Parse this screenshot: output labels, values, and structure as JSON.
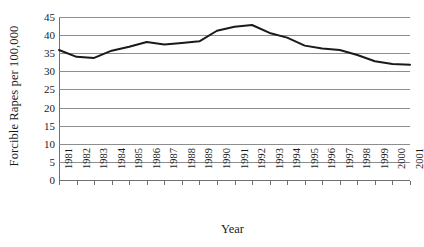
{
  "chart_data": {
    "type": "line",
    "title": "",
    "xlabel": "Year",
    "ylabel": "Forcible Rapes per 100,000",
    "categories": [
      "1981",
      "1982",
      "1983",
      "1984",
      "1985",
      "1986",
      "1987",
      "1988",
      "1989",
      "1990",
      "1991",
      "1992",
      "1993",
      "1994",
      "1995",
      "1996",
      "1997",
      "1998",
      "1999",
      "2000",
      "2001"
    ],
    "x": [
      1981,
      1982,
      1983,
      1984,
      1985,
      1986,
      1987,
      1988,
      1989,
      1990,
      1991,
      1992,
      1993,
      1994,
      1995,
      1996,
      1997,
      1998,
      1999,
      2000,
      2001
    ],
    "values": [
      35.9,
      34.0,
      33.7,
      35.7,
      36.8,
      38.1,
      37.4,
      37.8,
      38.3,
      41.2,
      42.3,
      42.8,
      40.6,
      39.3,
      37.1,
      36.3,
      35.9,
      34.5,
      32.8,
      32.0,
      31.8
    ],
    "series": [
      {
        "name": "Forcible Rapes per 100,000",
        "values": [
          35.9,
          34.0,
          33.7,
          35.7,
          36.8,
          38.1,
          37.4,
          37.8,
          38.3,
          41.2,
          42.3,
          42.8,
          40.6,
          39.3,
          37.1,
          36.3,
          35.9,
          34.5,
          32.8,
          32.0,
          31.8
        ],
        "color": "#1a1a1a"
      }
    ],
    "ylim": [
      0,
      45
    ],
    "yticks": [
      0,
      5,
      10,
      15,
      20,
      25,
      30,
      35,
      40,
      45
    ],
    "ytick_labels": [
      "0",
      "5",
      "10",
      "15",
      "20",
      "25",
      "30",
      "35",
      "40",
      "45"
    ],
    "xlim": [
      1981,
      2001
    ],
    "grid": true,
    "grid_axis": "y",
    "grid_color": "#8d8d8d",
    "legend": false,
    "legend_position": "none",
    "line_width": 2,
    "background": "#ffffff",
    "axis_color": "#6f6f6f"
  }
}
